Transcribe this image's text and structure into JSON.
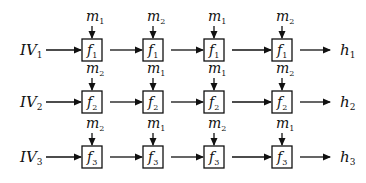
{
  "rows": [
    {
      "input": {
        "base": "IV",
        "sub": "1"
      },
      "output": {
        "base": "h",
        "sub": "1"
      },
      "cells": [
        {
          "f": {
            "base": "f",
            "sub": "1"
          },
          "m": {
            "base": "m",
            "sub": "1"
          }
        },
        {
          "f": {
            "base": "f",
            "sub": "1"
          },
          "m": {
            "base": "m",
            "sub": "2"
          }
        },
        {
          "f": {
            "base": "f",
            "sub": "1"
          },
          "m": {
            "base": "m",
            "sub": "1"
          }
        },
        {
          "f": {
            "base": "f",
            "sub": "1"
          },
          "m": {
            "base": "m",
            "sub": "2"
          }
        }
      ]
    },
    {
      "input": {
        "base": "IV",
        "sub": "2"
      },
      "output": {
        "base": "h",
        "sub": "2"
      },
      "cells": [
        {
          "f": {
            "base": "f",
            "sub": "2"
          },
          "m": {
            "base": "m",
            "sub": "2"
          }
        },
        {
          "f": {
            "base": "f",
            "sub": "2"
          },
          "m": {
            "base": "m",
            "sub": "1"
          }
        },
        {
          "f": {
            "base": "f",
            "sub": "2"
          },
          "m": {
            "base": "m",
            "sub": "1"
          }
        },
        {
          "f": {
            "base": "f",
            "sub": "2"
          },
          "m": {
            "base": "m",
            "sub": "2"
          }
        }
      ]
    },
    {
      "input": {
        "base": "IV",
        "sub": "3"
      },
      "output": {
        "base": "h",
        "sub": "3"
      },
      "cells": [
        {
          "f": {
            "base": "f",
            "sub": "3"
          },
          "m": {
            "base": "m",
            "sub": "2"
          }
        },
        {
          "f": {
            "base": "f",
            "sub": "3"
          },
          "m": {
            "base": "m",
            "sub": "1"
          }
        },
        {
          "f": {
            "base": "f",
            "sub": "3"
          },
          "m": {
            "base": "m",
            "sub": "2"
          }
        },
        {
          "f": {
            "base": "f",
            "sub": "3"
          },
          "m": {
            "base": "m",
            "sub": "1"
          }
        }
      ]
    }
  ],
  "colors": {
    "stroke": "#111111",
    "background": "#ffffff"
  }
}
